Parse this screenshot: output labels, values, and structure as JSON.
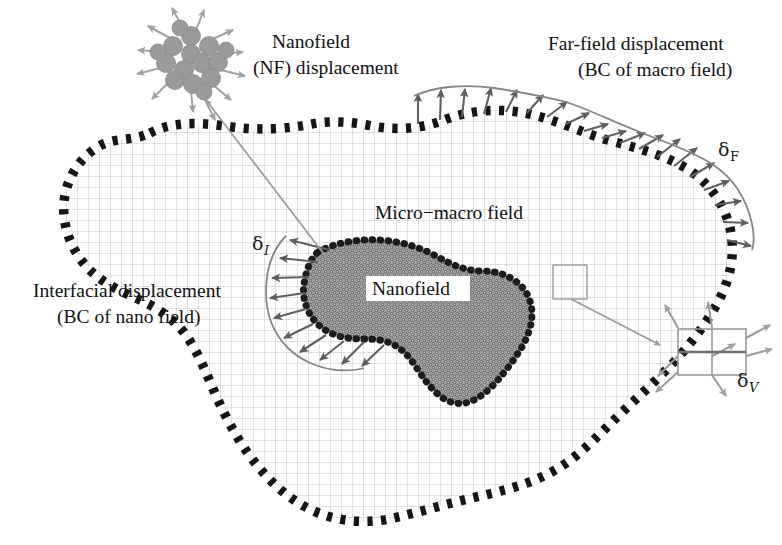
{
  "figure": {
    "type": "scientific-diagram"
  },
  "labels": {
    "nanofield_inset_line1": "Nanofield",
    "nanofield_inset_line2": "(NF) displacement",
    "farfield_line1": "Far-field displacement",
    "farfield_line2": "(BC of macro field)",
    "interfacial_line1": "Interfacial displacement",
    "interfacial_line2": "(BC of nano field)",
    "micro_macro": "Micro−macro field",
    "nanofield_region": "Nanofield"
  },
  "symbols": {
    "delta": "δ",
    "far_field_sub": "F",
    "interfacial_sub": "I",
    "volume_sub": "V"
  },
  "colors": {
    "boundary_dots": "#151515",
    "mesh_grid": "#b9bcc2",
    "arrow_gray": "#6e6e6e",
    "nano_fill": "#8c8c8c",
    "nano_dot_outline": "#1b1b1b",
    "particle_gray": "#9a9a9a",
    "leader_line": "#9b9b9b",
    "text": "#111111",
    "background": "#ffffff"
  },
  "elements": {
    "macro_field_name": "micro-macro field domain",
    "nano_field_name": "nanofield inclusion",
    "particle_cluster_name": "nanoparticle cluster inset",
    "unit_cell_name": "volume element inset"
  }
}
